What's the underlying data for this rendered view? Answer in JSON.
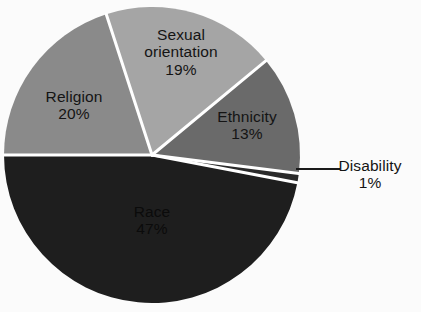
{
  "chart_data": {
    "type": "pie",
    "title": "",
    "subtitle": "",
    "legend_position": "none",
    "grid": false,
    "total_percent": 100,
    "categories": [
      "Race",
      "Religion",
      "Sexual orientation",
      "Ethnicity",
      "Disability"
    ],
    "values": [
      47,
      20,
      19,
      13,
      1
    ],
    "labels": [
      "47%",
      "20%",
      "19%",
      "13%",
      "1%"
    ],
    "slices": [
      {
        "name": "Race",
        "value": 47,
        "label": "Race",
        "percent_label": "47%",
        "color": "#1e1e1e",
        "label_placement": "inside"
      },
      {
        "name": "Religion",
        "value": 20,
        "label": "Religion",
        "percent_label": "20%",
        "color": "#8a8a8a",
        "label_placement": "inside"
      },
      {
        "name": "Sexual orientation",
        "value": 19,
        "label_line1": "Sexual",
        "label_line2": "orientation",
        "label": "Sexual orientation",
        "percent_label": "19%",
        "color": "#a5a5a5",
        "label_placement": "inside"
      },
      {
        "name": "Ethnicity",
        "value": 13,
        "label": "Ethnicity",
        "percent_label": "13%",
        "color": "#6a6a6a",
        "label_placement": "inside"
      },
      {
        "name": "Disability",
        "value": 1,
        "label": "Disability",
        "percent_label": "1%",
        "color": "#2a2a2a",
        "label_placement": "outside-with-leader-line"
      }
    ],
    "style": {
      "background": "#fbfbfb",
      "separator_color": "#ffffff",
      "separator_width": 3,
      "leader_line_color": "#1a1a1a",
      "text_color": "#141414"
    }
  }
}
